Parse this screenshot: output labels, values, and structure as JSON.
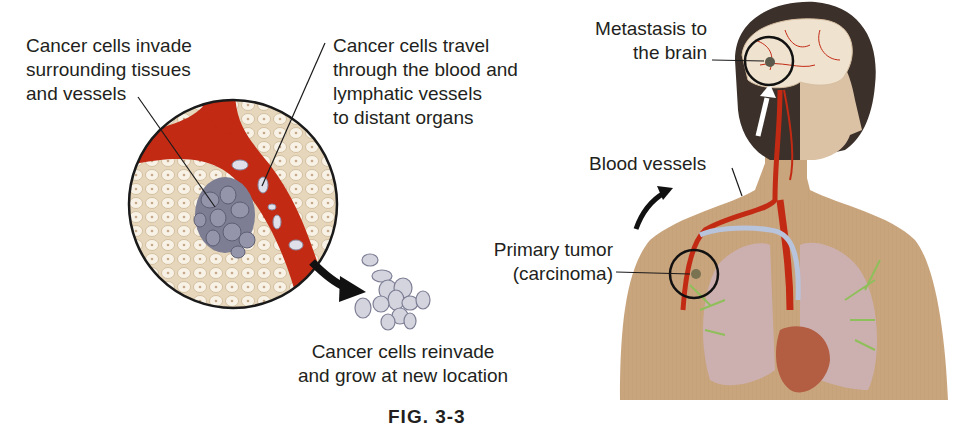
{
  "diagram": {
    "left_panel": {
      "labels": {
        "invade": "Cancer cells invade\nsurrounding tissues\nand vessels",
        "travel": "Cancer cells travel\nthrough the blood and\nlymphatic vessels\nto distant organs",
        "reinvade": "Cancer cells reinvade\nand grow at new location"
      }
    },
    "right_panel": {
      "labels": {
        "brain": "Metastasis to\nthe brain",
        "vessels": "Blood vessels",
        "tumor": "Primary tumor\n(carcinoma)"
      }
    },
    "caption": "FIG. 3-3 (partially visible)",
    "caption_visible": "FIG. 3-3"
  },
  "colors": {
    "blood": "#c22a14",
    "tissue": "#efe5d2",
    "tissue_cell": "#f8f2e6",
    "tumor": "#7d7e93",
    "cancer_cell": "#c9cad6",
    "skin": "#c9a57e",
    "hair": "#3b302a",
    "lung": "#cdb1b8",
    "lymph": "#8fbf5a",
    "vein": "#b8c3dc",
    "text": "#231f20"
  }
}
